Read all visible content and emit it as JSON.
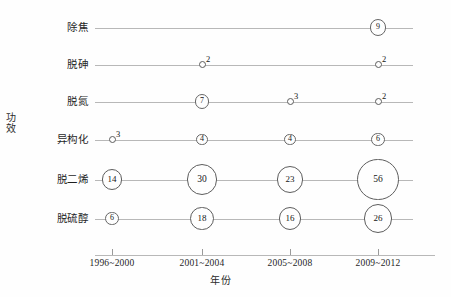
{
  "chart_data": {
    "type": "scatter",
    "title": "",
    "xlabel": "年份",
    "ylabel": "功效",
    "grid": false,
    "legend": "none",
    "categories": [
      "1996~2000",
      "2001~2004",
      "2005~2008",
      "2009~2012"
    ],
    "rows": [
      {
        "label": "除焦",
        "values": [
          null,
          null,
          null,
          9
        ]
      },
      {
        "label": "脱砷",
        "values": [
          null,
          2,
          null,
          2
        ]
      },
      {
        "label": "脱氮",
        "values": [
          null,
          7,
          3,
          2
        ]
      },
      {
        "label": "异构化",
        "values": [
          3,
          4,
          4,
          6
        ]
      },
      {
        "label": "脱二烯",
        "values": [
          14,
          30,
          23,
          56
        ]
      },
      {
        "label": "脱硫醇",
        "values": [
          6,
          18,
          16,
          26
        ]
      }
    ],
    "value_range": [
      2,
      56
    ],
    "marker_shape": "circle-with-inner-number",
    "colors": {
      "background": "#fefefe",
      "line": "#b8b8b8",
      "marker_stroke": "#5d5d5d",
      "text": "#161616"
    }
  },
  "axes": {
    "y_title": "功效",
    "x_title": "年份",
    "x_ticks": [
      "1996~2000",
      "2001~2004",
      "2005~2008",
      "2009~2012"
    ]
  }
}
